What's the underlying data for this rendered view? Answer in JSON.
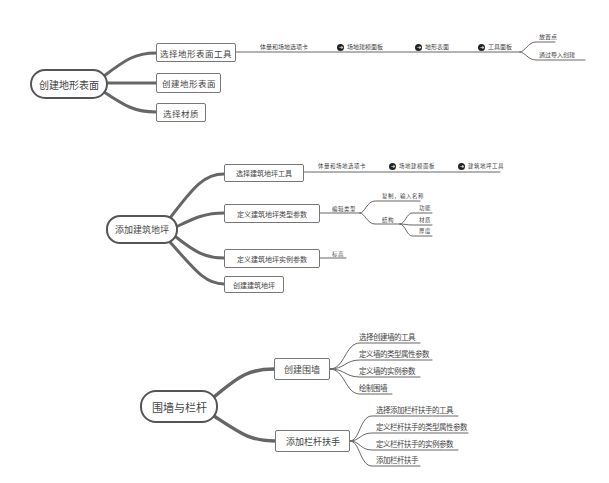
{
  "maps": [
    {
      "root": "创建地形表面",
      "children": [
        {
          "label": "选择地形表面工具",
          "path": [
            "体量和场地选项卡",
            "场地建模面板",
            "地形表面",
            "工具面板"
          ],
          "path_icon": "arrow-right-circle-icon",
          "leaves": [
            "放置点",
            "通过导入创建"
          ]
        },
        {
          "label": "创建地形表面"
        },
        {
          "label": "选择材质"
        }
      ]
    },
    {
      "root": "添加建筑地坪",
      "children": [
        {
          "label": "选择建筑地坪工具",
          "path": [
            "体量和场地选项卡",
            "场地建模面板",
            "建筑地坪工具"
          ],
          "path_icon": "arrow-right-circle-icon"
        },
        {
          "label": "定义建筑地坪类型参数",
          "sub": {
            "label": "编辑类型",
            "items": [
              {
                "label": "复制，输入名称"
              },
              {
                "label": "结构",
                "items": [
                  "功能",
                  "材质",
                  "厚度"
                ]
              }
            ]
          }
        },
        {
          "label": "定义建筑地坪实例参数",
          "sub": {
            "label": "标高"
          }
        },
        {
          "label": "创建建筑地坪"
        }
      ]
    },
    {
      "root": "围墙与栏杆",
      "children": [
        {
          "label": "创建围墙",
          "leaves": [
            "选择创建墙的工具",
            "定义墙的类型属性参数",
            "定义墙的实例参数",
            "绘制围墙"
          ]
        },
        {
          "label": "添加栏杆扶手",
          "leaves": [
            "选择添加栏杆扶手的工具",
            "定义栏杆扶手的类型属性参数",
            "定义栏杆扶手的实例参数",
            "添加栏杆扶手"
          ]
        }
      ]
    }
  ],
  "colors": {
    "line": "#666666",
    "text": "#444444",
    "icon": "#222222"
  }
}
